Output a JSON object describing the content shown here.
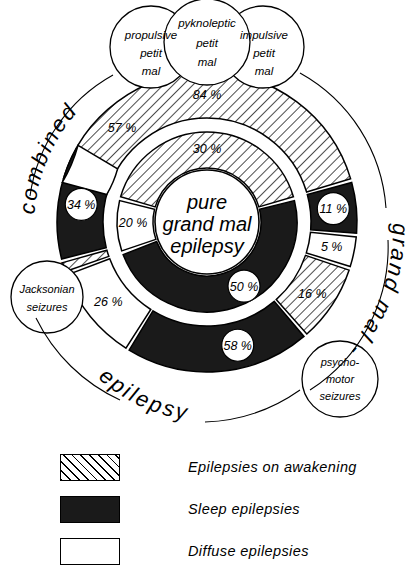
{
  "figure": {
    "center_label": [
      "pure",
      "grand mal",
      "epilepsy"
    ],
    "arc_labels": {
      "left": "combined",
      "right": "grand mal -",
      "bottom": "epilepsy"
    },
    "top_circles": [
      {
        "name": "propulsive-petit-mal",
        "lines": [
          "propulsive",
          "petit",
          "mal"
        ]
      },
      {
        "name": "pyknoleptic-petit-mal",
        "lines": [
          "pyknoleptic",
          "petit",
          "mal"
        ]
      },
      {
        "name": "impulsive-petit-mal",
        "lines": [
          "impulsive",
          "petit",
          "mal"
        ]
      }
    ],
    "callouts": [
      {
        "name": "jacksonian-seizures",
        "lines": [
          "Jacksonian",
          "seizures"
        ]
      },
      {
        "name": "psychomotor-seizures",
        "lines": [
          "psycho-",
          "motor",
          "seizures"
        ]
      }
    ]
  },
  "chart_data": {
    "type": "pie",
    "title": "pure grand mal epilepsy",
    "legend_position": "bottom",
    "categories": [
      "Epilepsies on awakening",
      "Sleep epilepsies",
      "Diffuse epilepsies"
    ],
    "series": [
      {
        "name": "inner ring (pure grand mal epilepsy)",
        "slices": [
          {
            "label": "30 %",
            "value": 30,
            "category": "Epilepsies on awakening",
            "fill": "hatch"
          },
          {
            "label": "50 %",
            "value": 50,
            "category": "Sleep epilepsies",
            "fill": "solid"
          },
          {
            "label": "20 %",
            "value": 20,
            "category": "Diffuse epilepsies",
            "fill": "white"
          }
        ]
      },
      {
        "name": "outer ring (combined / grand mal / epilepsy)",
        "slices": [
          {
            "label": "84 %",
            "value": 84,
            "category": "Epilepsies on awakening",
            "fill": "hatch",
            "group": "combined"
          },
          {
            "label": "11 %",
            "value": 11,
            "category": "Sleep epilepsies",
            "fill": "solid",
            "group": "grand mal"
          },
          {
            "label": "5 %",
            "value": 5,
            "category": "Diffuse epilepsies",
            "fill": "white",
            "group": "grand mal"
          },
          {
            "label": "16 %",
            "value": 16,
            "category": "Epilepsies on awakening",
            "fill": "hatch",
            "group": "grand mal"
          },
          {
            "label": "58 %",
            "value": 58,
            "category": "Sleep epilepsies",
            "fill": "solid",
            "group": "epilepsy"
          },
          {
            "label": "26 %",
            "value": 26,
            "category": "Diffuse epilepsies",
            "fill": "white",
            "group": "epilepsy"
          },
          {
            "label": "9 %",
            "value": 9,
            "category": "Epilepsies on awakening",
            "fill": "hatch",
            "group": "epilepsy"
          },
          {
            "label": "34 %",
            "value": 34,
            "category": "Sleep epilepsies",
            "fill": "solid",
            "group": "combined"
          },
          {
            "label": "57 %",
            "value": 57,
            "category": "Diffuse epilepsies",
            "fill": "white",
            "group": "combined"
          }
        ]
      }
    ]
  },
  "legend": {
    "items": [
      {
        "name": "legend-awakening",
        "swatch": "hatch",
        "label": "Epilepsies  on  awakening"
      },
      {
        "name": "legend-sleep",
        "swatch": "solid",
        "label": "Sleep   epilepsies"
      },
      {
        "name": "legend-diffuse",
        "swatch": "white",
        "label": "Diffuse   epilepsies"
      }
    ]
  }
}
